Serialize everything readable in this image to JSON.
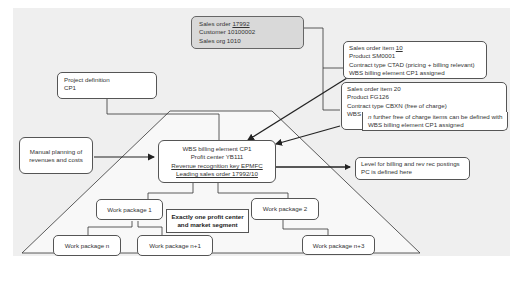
{
  "diagram": {
    "sales_order": {
      "label_prefix": "Sales order ",
      "number": "17992",
      "customer": "Customer 10100002",
      "sales_org": "Sales org 1010"
    },
    "item_10": {
      "label_prefix": "Sales order item ",
      "number": "10",
      "product": "Product SM0001",
      "contract_type": "Contract type CTAD (pricing + billing relevant)",
      "wbs": "WBS billing element CP1 assigned"
    },
    "item_20": {
      "label": "Sales order item 20",
      "product": "Product FG126",
      "contract_type": "Contract type CBXN (free of charge)",
      "wbs": "WBS billing element CP1",
      "note_line1": "n further free of charge items can be defined with",
      "note_line1_italic_prefix": "n",
      "note_line1_rest": " further free of charge items can be defined with",
      "note_line2": "WBS billing element CP1 assigned"
    },
    "project_definition": {
      "line1": "Project definition",
      "line2": "CP1"
    },
    "manual_planning": {
      "line1": "Manual planning of",
      "line2": "revenues and costs"
    },
    "wbs_element": {
      "line1": "WBS billing element CP1",
      "line2": "Profit center YB111",
      "line3": "Revenue recognition key EPMFC",
      "line4": "Leading sales order 17992/10"
    },
    "level_note": {
      "line1": "Level for billing and rev rec postings",
      "line2": "PC is defined here"
    },
    "work_packages": {
      "wp1": "Work package 1",
      "wp2": "Work package 2",
      "wpn": "Work package n",
      "wpn1": "Work package n+1",
      "wpn3": "Work package n+3"
    },
    "callout": {
      "line1": "Exactly one profit center",
      "line2": "and market segment"
    },
    "colors": {
      "background_panel": "#efefef",
      "sales_order_fill": "#d9d9d9",
      "box_fill": "#ffffff",
      "stroke": "#333333"
    }
  }
}
